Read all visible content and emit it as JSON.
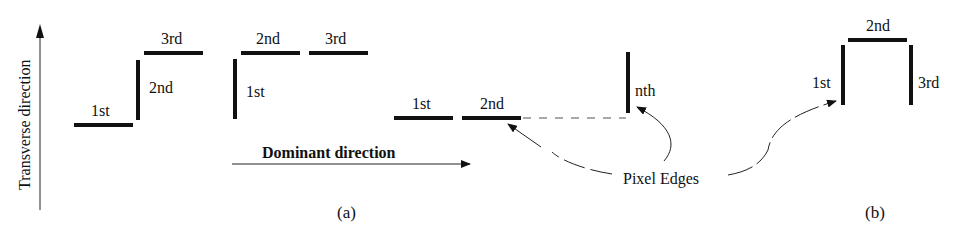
{
  "colors": {
    "ink": "#111111",
    "background": "#ffffff",
    "dashed": "#555555"
  },
  "axes": {
    "vertical_label": "Transverse direction",
    "horizontal_label": "Dominant direction"
  },
  "panel_a": {
    "caption": "(a)",
    "group1": {
      "labels": [
        "1st",
        "2nd",
        "3rd"
      ]
    },
    "group2": {
      "labels": [
        "1st",
        "2nd",
        "3rd"
      ]
    },
    "group3": {
      "labels": [
        "1st",
        "2nd",
        "nth"
      ]
    }
  },
  "panel_b": {
    "caption": "(b)",
    "labels": [
      "1st",
      "2nd",
      "3rd"
    ]
  },
  "annotation": {
    "label": "Pixel Edges"
  }
}
